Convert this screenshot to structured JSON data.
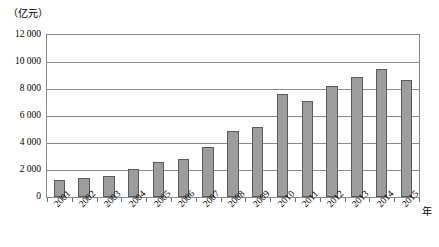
{
  "chart_data": {
    "type": "bar",
    "title": "",
    "subtitle": "",
    "xlabel": "年",
    "ylabel": "（亿元）",
    "categories": [
      "2001",
      "2002",
      "2003",
      "2004",
      "2005",
      "2006",
      "2007",
      "2008",
      "2009",
      "2010",
      "2011",
      "2012",
      "2013",
      "2014",
      "2015"
    ],
    "values": [
      1250,
      1400,
      1550,
      2100,
      2600,
      2800,
      3700,
      4900,
      5200,
      7600,
      7100,
      8200,
      8900,
      9500,
      8700
    ],
    "series": [
      {
        "name": "",
        "values": [
          1250,
          1400,
          1550,
          2100,
          2600,
          2800,
          3700,
          4900,
          5200,
          7600,
          7100,
          8200,
          8900,
          9500,
          8700
        ]
      }
    ],
    "ylim": [
      0,
      12000
    ],
    "ytick_values": [
      0,
      2000,
      4000,
      6000,
      8000,
      10000,
      12000
    ],
    "ytick_labels": [
      "0",
      "2 000",
      "4 000",
      "6 000",
      "8 000",
      "10 000",
      "12 000"
    ],
    "grid": true,
    "grid_axis": "y",
    "legend": false,
    "legend_position": "none",
    "bar_color": "#9d9d9d",
    "bar_edge_color": "#5a5a5a",
    "axis_color": "#8a8a8a",
    "xtick_rotation": -45
  },
  "axes": {
    "y_unit_caption": "（亿元）",
    "x_unit_caption": "年"
  }
}
